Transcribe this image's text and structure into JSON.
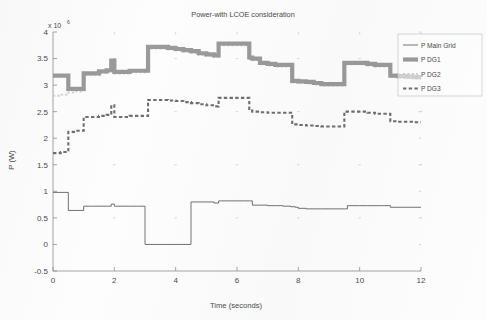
{
  "chart_data": {
    "type": "line",
    "title": "Power-with LCOE consideration",
    "xlabel": "Time (seconds)",
    "ylabel": "P (W)",
    "y_exponent_prefix": "x 10",
    "y_exponent_power": "6",
    "xlim": [
      0,
      12
    ],
    "ylim": [
      -0.5,
      4
    ],
    "xticks": [
      0,
      2,
      4,
      6,
      8,
      10,
      12
    ],
    "xtick_labels": [
      "0",
      "2",
      "4",
      "6",
      "8",
      "10",
      "12"
    ],
    "yticks": [
      -0.5,
      0,
      0.5,
      1,
      1.5,
      2,
      2.5,
      3,
      3.5,
      4
    ],
    "ytick_labels": [
      "-0.5",
      "0",
      "0.5",
      "1",
      "1.5",
      "2",
      "2.5",
      "3",
      "3.5",
      "4"
    ],
    "grid": false,
    "legend_position": "upper right",
    "y_units": "W (×10^6)",
    "step_style": "post",
    "series": [
      {
        "name": "P Main Grid",
        "style": "solid-thin",
        "color": "#5a5a5a",
        "x": [
          0,
          0.5,
          0.5,
          0.75,
          1,
          1.25,
          1.5,
          1.75,
          1.9,
          2.0,
          2.25,
          2.5,
          2.75,
          3.0,
          3.0,
          4.5,
          4.5,
          4.75,
          5.0,
          5.25,
          5.4,
          5.5,
          5.75,
          6.0,
          6.25,
          6.4,
          6.5,
          6.75,
          7.0,
          7.25,
          7.5,
          7.75,
          7.9,
          8.0,
          8.25,
          8.5,
          8.75,
          9.0,
          9.25,
          9.5,
          9.6,
          9.75,
          10.0,
          10.25,
          10.5,
          10.75,
          11.0,
          11.25,
          11.5,
          11.75,
          12.0
        ],
        "y": [
          0.98,
          0.98,
          0.64,
          0.64,
          0.72,
          0.72,
          0.72,
          0.72,
          0.76,
          0.72,
          0.72,
          0.72,
          0.72,
          0.72,
          0.0,
          0.0,
          0.8,
          0.8,
          0.8,
          0.78,
          0.82,
          0.82,
          0.82,
          0.82,
          0.82,
          0.82,
          0.74,
          0.74,
          0.73,
          0.73,
          0.72,
          0.71,
          0.7,
          0.68,
          0.67,
          0.67,
          0.67,
          0.67,
          0.67,
          0.67,
          0.73,
          0.73,
          0.73,
          0.73,
          0.73,
          0.73,
          0.7,
          0.7,
          0.7,
          0.7,
          0.7
        ]
      },
      {
        "name": "P DG1",
        "style": "solid-thick",
        "color": "#9a9a9a",
        "x": [
          0,
          0.25,
          0.5,
          0.5,
          0.75,
          1.0,
          1.0,
          1.25,
          1.5,
          1.75,
          1.9,
          1.9,
          2.0,
          2.25,
          2.5,
          2.75,
          3.0,
          3.1,
          3.1,
          3.25,
          3.5,
          3.75,
          4.0,
          4.25,
          4.5,
          4.75,
          5.0,
          5.25,
          5.4,
          5.4,
          5.5,
          5.75,
          6.0,
          6.25,
          6.4,
          6.4,
          6.5,
          6.75,
          7.0,
          7.25,
          7.5,
          7.75,
          7.8,
          7.8,
          8.0,
          8.25,
          8.5,
          8.75,
          9.0,
          9.25,
          9.5,
          9.5,
          9.75,
          10.0,
          10.25,
          10.5,
          10.75,
          11.0,
          11.0,
          11.25,
          11.5,
          11.75,
          12.0
        ],
        "y": [
          3.18,
          3.18,
          3.18,
          2.93,
          2.93,
          2.93,
          3.22,
          3.22,
          3.26,
          3.28,
          3.28,
          3.46,
          3.25,
          3.25,
          3.27,
          3.27,
          3.27,
          3.27,
          3.72,
          3.72,
          3.72,
          3.7,
          3.68,
          3.66,
          3.64,
          3.6,
          3.58,
          3.56,
          3.56,
          3.78,
          3.78,
          3.78,
          3.78,
          3.78,
          3.78,
          3.52,
          3.5,
          3.42,
          3.4,
          3.38,
          3.38,
          3.38,
          3.38,
          3.08,
          3.07,
          3.06,
          3.04,
          3.02,
          3.02,
          3.02,
          3.02,
          3.42,
          3.42,
          3.42,
          3.4,
          3.38,
          3.38,
          3.38,
          3.18,
          3.17,
          3.16,
          3.15,
          3.15
        ]
      },
      {
        "name": "P DG2",
        "style": "dotted",
        "color": "#cfcfcf",
        "x": [
          0,
          0.25,
          0.5,
          0.5,
          0.75,
          1.0,
          1.0,
          1.25,
          1.5,
          1.75,
          1.9,
          1.9,
          2.0,
          2.25,
          2.5,
          2.75,
          3.0,
          3.1,
          3.1,
          3.25,
          3.5,
          3.75,
          4.0,
          4.25,
          4.5,
          4.75,
          5.0,
          5.25,
          5.4,
          5.4,
          5.5,
          5.75,
          6.0,
          6.25,
          6.4,
          6.4,
          6.5,
          6.75,
          7.0,
          7.25,
          7.5,
          7.75,
          7.8,
          7.8,
          8.0,
          8.25,
          8.5,
          8.75,
          9.0,
          9.25,
          9.5,
          9.5,
          9.75,
          10.0,
          10.25,
          10.5,
          10.75,
          11.0,
          11.0,
          11.25,
          11.5,
          11.75,
          12.0
        ],
        "y": [
          2.8,
          2.82,
          2.84,
          2.86,
          2.88,
          2.9,
          3.19,
          3.19,
          3.23,
          3.25,
          3.25,
          3.43,
          3.22,
          3.22,
          3.24,
          3.24,
          3.24,
          3.24,
          3.69,
          3.69,
          3.69,
          3.67,
          3.65,
          3.63,
          3.61,
          3.57,
          3.55,
          3.53,
          3.53,
          3.75,
          3.75,
          3.75,
          3.75,
          3.75,
          3.75,
          3.49,
          3.47,
          3.39,
          3.37,
          3.35,
          3.35,
          3.35,
          3.35,
          3.05,
          3.04,
          3.03,
          3.01,
          2.99,
          2.99,
          2.99,
          2.99,
          3.39,
          3.39,
          3.39,
          3.37,
          3.35,
          3.35,
          3.35,
          3.15,
          3.14,
          3.13,
          3.12,
          3.12
        ]
      },
      {
        "name": "P DG3",
        "style": "dashed",
        "color": "#6f6f6f",
        "x": [
          0,
          0.25,
          0.25,
          0.5,
          0.5,
          0.75,
          0.75,
          1.0,
          1.0,
          1.25,
          1.5,
          1.75,
          1.9,
          1.9,
          2.0,
          2.25,
          2.5,
          2.75,
          3.0,
          3.1,
          3.1,
          3.25,
          3.5,
          3.75,
          4.0,
          4.25,
          4.5,
          4.75,
          5.0,
          5.25,
          5.4,
          5.4,
          5.5,
          5.75,
          6.0,
          6.25,
          6.4,
          6.4,
          6.5,
          6.75,
          7.0,
          7.25,
          7.5,
          7.75,
          7.8,
          7.8,
          8.0,
          8.25,
          8.5,
          8.75,
          9.0,
          9.25,
          9.5,
          9.5,
          9.75,
          10.0,
          10.25,
          10.5,
          10.75,
          11.0,
          11.0,
          11.25,
          11.5,
          11.75,
          12.0
        ],
        "y": [
          1.72,
          1.72,
          1.74,
          1.74,
          2.12,
          2.12,
          2.14,
          2.14,
          2.4,
          2.4,
          2.42,
          2.44,
          2.44,
          2.62,
          2.4,
          2.4,
          2.42,
          2.42,
          2.42,
          2.42,
          2.72,
          2.72,
          2.72,
          2.71,
          2.7,
          2.68,
          2.66,
          2.64,
          2.62,
          2.6,
          2.6,
          2.76,
          2.76,
          2.76,
          2.76,
          2.76,
          2.76,
          2.52,
          2.5,
          2.49,
          2.48,
          2.48,
          2.48,
          2.48,
          2.48,
          2.26,
          2.25,
          2.24,
          2.23,
          2.22,
          2.22,
          2.22,
          2.22,
          2.5,
          2.5,
          2.5,
          2.48,
          2.46,
          2.46,
          2.46,
          2.32,
          2.31,
          2.31,
          2.3,
          2.3
        ]
      }
    ]
  },
  "legend": {
    "items": [
      {
        "label": "P Main Grid",
        "marker": "line-solid-thin"
      },
      {
        "label": "P DG1",
        "marker": "line-solid-thick"
      },
      {
        "label": "P DG2",
        "marker": "line-dotted"
      },
      {
        "label": "P DG3",
        "marker": "line-dashed"
      }
    ]
  }
}
